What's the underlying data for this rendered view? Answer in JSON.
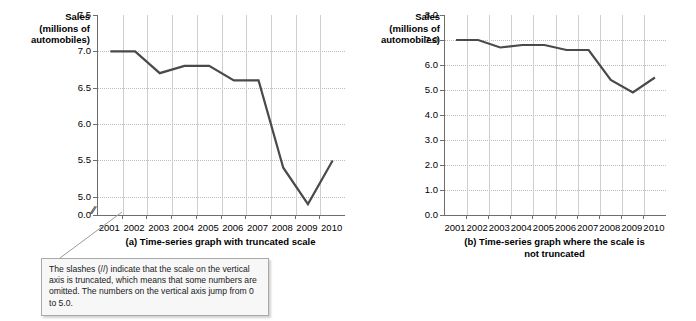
{
  "figure": {
    "axis_label": {
      "line1": "Sales",
      "line2": "(millions of",
      "line3": "automobiles)"
    },
    "series_color": "#4a4a4a",
    "axis_color": "#6d6d6d",
    "grid_color": "#c8c8c8"
  },
  "callout": {
    "text": "The slashes (//) indicate that the scale on the vertical axis is truncated, which means that some numbers are omitted. The numbers on the vertical axis jump from 0 to 5.0.",
    "truncation_glyph": "//"
  },
  "panel_a": {
    "caption": "(a) Time-series graph with truncated scale",
    "caption_line2": ""
  },
  "panel_b": {
    "caption": "(b) Time-series graph where the scale is",
    "caption_line2": "not truncated"
  },
  "chart_data": [
    {
      "id": "truncated",
      "type": "line",
      "title": "(a) Time-series graph with truncated scale",
      "xlabel": "",
      "ylabel": "Sales (millions of automobiles)",
      "x": [
        "2001",
        "2002",
        "2003",
        "2004",
        "2005",
        "2006",
        "2007",
        "2008",
        "2009",
        "2010"
      ],
      "values": [
        7.0,
        7.0,
        6.7,
        6.8,
        6.8,
        6.6,
        6.6,
        5.4,
        4.9,
        5.5
      ],
      "ylim": [
        4.75,
        7.5
      ],
      "yticks": [
        "0.0",
        "5.0",
        "5.5",
        "6.0",
        "6.5",
        "7.0",
        "7.5"
      ],
      "ytick_values": [
        4.75,
        5.0,
        5.5,
        6.0,
        6.5,
        7.0,
        7.5
      ],
      "truncated_axis": true,
      "grid": true,
      "legend": "none"
    },
    {
      "id": "not-truncated",
      "type": "line",
      "title": "(b) Time-series graph where the scale is not truncated",
      "xlabel": "",
      "ylabel": "Sales (millions of automobiles)",
      "x": [
        "2001",
        "2002",
        "2003",
        "2004",
        "2005",
        "2006",
        "2007",
        "2008",
        "2009",
        "2010"
      ],
      "values": [
        7.0,
        7.0,
        6.7,
        6.8,
        6.8,
        6.6,
        6.6,
        5.4,
        4.9,
        5.5
      ],
      "ylim": [
        0,
        8
      ],
      "yticks": [
        "0.0",
        "1.0",
        "2.0",
        "3.0",
        "4.0",
        "5.0",
        "6.0",
        "7.0",
        "8.0"
      ],
      "ytick_values": [
        0,
        1,
        2,
        3,
        4,
        5,
        6,
        7,
        8
      ],
      "truncated_axis": false,
      "grid": true,
      "legend": "none"
    }
  ]
}
